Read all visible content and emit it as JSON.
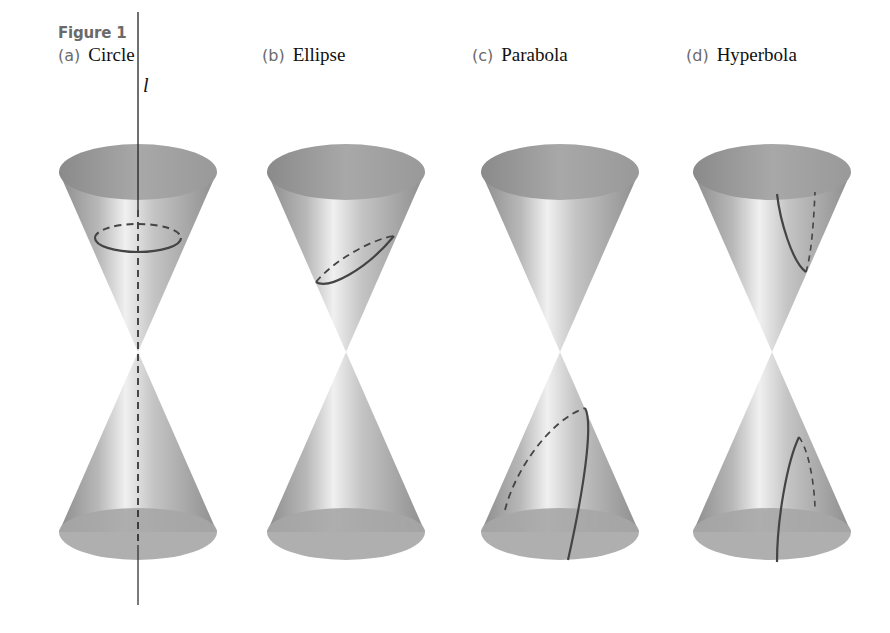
{
  "figure": {
    "title": "Figure 1",
    "axis_label": "l",
    "panels": [
      {
        "letter": "(a)",
        "name": "Circle",
        "cx": 138,
        "section": "circle"
      },
      {
        "letter": "(b)",
        "name": "Ellipse",
        "cx": 346,
        "section": "ellipse"
      },
      {
        "letter": "(c)",
        "name": "Parabola",
        "cx": 560,
        "section": "parabola"
      },
      {
        "letter": "(d)",
        "name": "Hyperbola",
        "cx": 772,
        "section": "hyperbola"
      }
    ],
    "colors": {
      "cone_dark": "#8a8a8a",
      "cone_mid": "#b0b0b0",
      "cone_light": "#ececec",
      "rim_fill": "#9a9a9a",
      "curve": "#555555"
    }
  }
}
